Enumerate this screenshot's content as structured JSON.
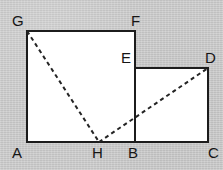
{
  "figure": {
    "background_color": "#cacaca",
    "fill_color": "#ffffff",
    "edge_color": "#1c1c1c",
    "dash_color": "#242424",
    "vertices": {
      "A": {
        "label": "A",
        "x": 27,
        "y": 142,
        "label_x": 12,
        "label_y": 158
      },
      "B": {
        "label": "B",
        "x": 135,
        "y": 142,
        "label_x": 128,
        "label_y": 158
      },
      "C": {
        "label": "C",
        "x": 208,
        "y": 142,
        "label_x": 208,
        "label_y": 158
      },
      "D": {
        "label": "D",
        "x": 208,
        "y": 68,
        "label_x": 205,
        "label_y": 63
      },
      "E": {
        "label": "E",
        "x": 135,
        "y": 68,
        "label_x": 121,
        "label_y": 63
      },
      "F": {
        "label": "F",
        "x": 135,
        "y": 31,
        "label_x": 131,
        "label_y": 26
      },
      "G": {
        "label": "G",
        "x": 27,
        "y": 31,
        "label_x": 12,
        "label_y": 26
      },
      "H": {
        "label": "H",
        "x": 99,
        "y": 142,
        "label_x": 92,
        "label_y": 158
      }
    },
    "shapes": [
      {
        "name": "large-rectangle",
        "points": "27,31 135,31 135,142 27,142"
      },
      {
        "name": "small-rectangle",
        "points": "135,68 208,68 208,142 135,142"
      }
    ],
    "solid_edges": [
      {
        "name": "edge-G-F",
        "x1": 27,
        "y1": 31,
        "x2": 135,
        "y2": 31
      },
      {
        "name": "edge-F-B",
        "x1": 135,
        "y1": 31,
        "x2": 135,
        "y2": 142
      },
      {
        "name": "edge-G-A",
        "x1": 27,
        "y1": 31,
        "x2": 27,
        "y2": 142
      },
      {
        "name": "edge-A-C",
        "x1": 27,
        "y1": 142,
        "x2": 208,
        "y2": 142
      },
      {
        "name": "edge-E-D",
        "x1": 135,
        "y1": 68,
        "x2": 208,
        "y2": 68
      },
      {
        "name": "edge-D-C",
        "x1": 208,
        "y1": 68,
        "x2": 208,
        "y2": 142
      }
    ],
    "dashed_segments": [
      {
        "name": "diagonal-G-H",
        "x1": 27,
        "y1": 31,
        "x2": 99,
        "y2": 142
      },
      {
        "name": "diagonal-H-D",
        "x1": 99,
        "y1": 142,
        "x2": 208,
        "y2": 68
      }
    ],
    "vertex_order": [
      "A",
      "B",
      "C",
      "D",
      "E",
      "F",
      "G",
      "H"
    ]
  }
}
